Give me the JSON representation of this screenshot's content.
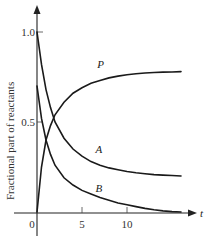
{
  "chart_data": {
    "type": "line",
    "title": "",
    "xlabel": "t",
    "ylabel": "Fractional part of reactants",
    "xlim": [
      -1,
      17
    ],
    "ylim": [
      -0.15,
      1.2
    ],
    "grid": false,
    "legend": "inline curve labels",
    "x_ticks": [
      0,
      5,
      10
    ],
    "x_tick_labels": [
      "0",
      "5",
      "10"
    ],
    "y_ticks": [
      0.5,
      1.0
    ],
    "y_tick_labels": [
      "0.5",
      "1.0"
    ],
    "series": [
      {
        "name": "A",
        "label_position": {
          "x": 6.5,
          "y": 0.33
        },
        "x": [
          0,
          0.5,
          1,
          1.5,
          2,
          3,
          4,
          5,
          6,
          7,
          8,
          9,
          10,
          11,
          12,
          13,
          14,
          15,
          16
        ],
        "values": [
          1.0,
          0.82,
          0.68,
          0.58,
          0.5,
          0.41,
          0.35,
          0.31,
          0.28,
          0.26,
          0.245,
          0.235,
          0.225,
          0.218,
          0.212,
          0.208,
          0.205,
          0.203,
          0.2
        ]
      },
      {
        "name": "B",
        "label_position": {
          "x": 6.5,
          "y": 0.11
        },
        "x": [
          0,
          0.5,
          1,
          1.5,
          2,
          3,
          4,
          5,
          6,
          7,
          8,
          9,
          10,
          11,
          12,
          13,
          14,
          15,
          16
        ],
        "values": [
          0.7,
          0.52,
          0.4,
          0.32,
          0.26,
          0.19,
          0.15,
          0.12,
          0.1,
          0.08,
          0.065,
          0.05,
          0.04,
          0.03,
          0.02,
          0.012,
          0.006,
          0.002,
          0.0
        ]
      },
      {
        "name": "P",
        "label_position": {
          "x": 6.7,
          "y": 0.8
        },
        "x": [
          0,
          0.5,
          1,
          1.5,
          2,
          3,
          4,
          5,
          6,
          7,
          8,
          9,
          10,
          11,
          12,
          13,
          14,
          15,
          16
        ],
        "values": [
          0.0,
          0.25,
          0.4,
          0.48,
          0.54,
          0.61,
          0.66,
          0.69,
          0.715,
          0.73,
          0.745,
          0.755,
          0.763,
          0.768,
          0.772,
          0.775,
          0.777,
          0.778,
          0.78
        ]
      }
    ]
  }
}
